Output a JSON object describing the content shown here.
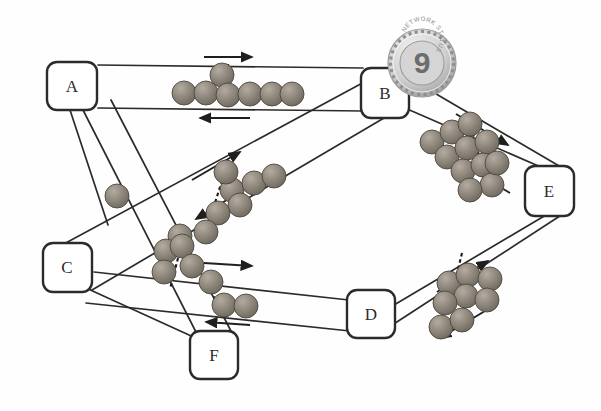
{
  "figure": {
    "kind": "network-topology-diagram",
    "background_color": "#ffffff",
    "line_color": "#2b2b2b",
    "packet_color": "#8b8378",
    "node_fill": "#ffffff",
    "node_stroke": "#2b2b2b"
  },
  "nodes": [
    {
      "id": "A",
      "label": "A",
      "x": 72,
      "y": 86
    },
    {
      "id": "B",
      "label": "B",
      "x": 385,
      "y": 93
    },
    {
      "id": "C",
      "label": "C",
      "x": 67,
      "y": 267
    },
    {
      "id": "D",
      "label": "D",
      "x": 370,
      "y": 314
    },
    {
      "id": "E",
      "label": "E",
      "x": 549,
      "y": 191
    },
    {
      "id": "F",
      "label": "F",
      "x": 214,
      "y": 355
    }
  ],
  "links": [
    {
      "id": "A-B",
      "from": "A",
      "to": "B",
      "bidirectional": true,
      "packet_count": 7,
      "has_marker": true
    },
    {
      "id": "C-B",
      "from": "C",
      "to": "B",
      "bidirectional": true,
      "packet_count": 8,
      "has_marker": true
    },
    {
      "id": "B-E",
      "from": "B",
      "to": "E",
      "bidirectional": true,
      "packet_count": 11,
      "has_marker": true
    },
    {
      "id": "D-E",
      "from": "D",
      "to": "E",
      "bidirectional": true,
      "packet_count": 8,
      "has_marker": true
    },
    {
      "id": "C-D",
      "from": "C",
      "to": "D",
      "bidirectional": true,
      "packet_count": 5,
      "has_marker": true
    },
    {
      "id": "A-F",
      "from": "A",
      "to": "F",
      "bidirectional": true,
      "packet_count": 4,
      "has_marker": false
    },
    {
      "id": "A-C",
      "from": "A",
      "to": "C",
      "bidirectional": false,
      "packet_count": 1,
      "has_marker": false
    },
    {
      "id": "C-F",
      "from": "C",
      "to": "F",
      "bidirectional": false,
      "packet_count": 0,
      "has_marker": false
    }
  ],
  "badge": {
    "value": "9",
    "rim_text": "NETWORK STATUS",
    "x": 422,
    "y": 63,
    "radius": 34
  },
  "legend": {
    "packet_name": "packet-sphere",
    "arrow_name": "flow-direction-arrow",
    "marker_name": "queue-marker-dashed-line"
  }
}
